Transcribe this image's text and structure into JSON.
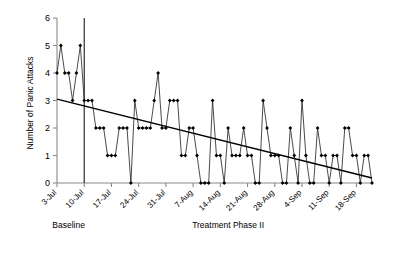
{
  "chart_data": {
    "type": "line",
    "title": "",
    "xlabel": "",
    "ylabel": "Number of Panic Attacks",
    "ylim": [
      0,
      6
    ],
    "yticks": [
      0,
      1,
      2,
      3,
      4,
      5,
      6
    ],
    "grid": false,
    "legend": null,
    "xtick_labels": [
      "3-Jul",
      "10-Jul",
      "17-Jul",
      "24-Jul",
      "31-Jul",
      "7-Aug",
      "14-Aug",
      "21-Aug",
      "28-Aug",
      "4-Sep",
      "11-Sep",
      "18-Sep"
    ],
    "xtick_days": [
      0,
      7,
      14,
      21,
      28,
      35,
      42,
      49,
      56,
      63,
      70,
      77
    ],
    "x": [
      0,
      1,
      2,
      3,
      4,
      5,
      6,
      7,
      8,
      9,
      10,
      11,
      12,
      13,
      14,
      15,
      16,
      17,
      18,
      19,
      20,
      21,
      22,
      23,
      24,
      25,
      26,
      27,
      28,
      29,
      30,
      31,
      32,
      33,
      34,
      35,
      36,
      37,
      38,
      39,
      40,
      41,
      42,
      43,
      44,
      45,
      46,
      47,
      48,
      49,
      50,
      51,
      52,
      53,
      54,
      55,
      56,
      57,
      58,
      59,
      60,
      61,
      62,
      63,
      64,
      65,
      66,
      67,
      68,
      69,
      70,
      71,
      72,
      73,
      74,
      75,
      76,
      77,
      78,
      79,
      80,
      81
    ],
    "values": [
      4,
      5,
      4,
      4,
      3,
      4,
      5,
      3,
      3,
      3,
      2,
      2,
      2,
      1,
      1,
      1,
      2,
      2,
      2,
      0,
      3,
      2,
      2,
      2,
      2,
      3,
      4,
      2,
      2,
      3,
      3,
      3,
      1,
      1,
      2,
      2,
      1,
      0,
      0,
      0,
      3,
      1,
      1,
      0,
      2,
      1,
      1,
      1,
      2,
      1,
      1,
      0,
      0,
      3,
      2,
      1,
      1,
      1,
      0,
      0,
      2,
      1,
      0,
      3,
      1,
      0,
      0,
      2,
      1,
      1,
      0,
      1,
      1,
      0,
      2,
      2,
      1,
      1,
      0,
      1,
      1,
      0
    ],
    "annotations": {
      "phase_divider_day": 7,
      "phase_labels": [
        {
          "text": "Baseline",
          "center_day": 3
        },
        {
          "text": "Treatment Phase II",
          "center_day": 44
        }
      ]
    },
    "trend": {
      "label": "linear trend",
      "start_day": 0,
      "start_value": 3.05,
      "end_day": 81,
      "end_value": 0.18
    },
    "marker_style": "diamond",
    "colors": {
      "series": "#2b2b2b",
      "trend": "#000000",
      "axis": "#8a8a8a",
      "divider": "#1a1a1a",
      "background": "#ffffff"
    }
  }
}
